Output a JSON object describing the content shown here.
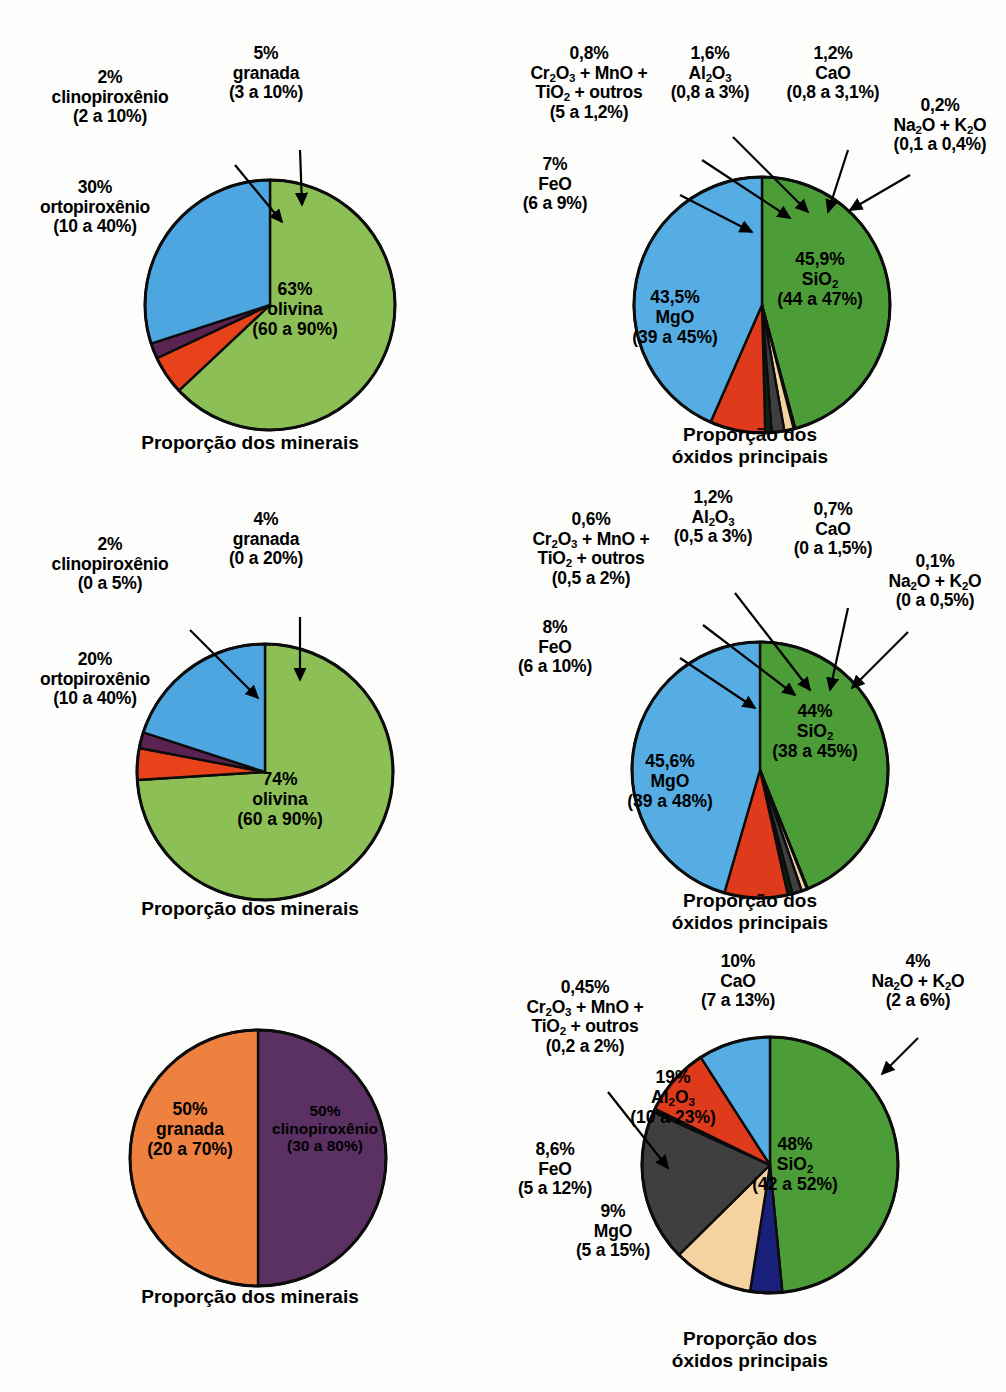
{
  "figure": {
    "background": "#fdfdfb",
    "width": 1006,
    "height": 1392
  },
  "palette": {
    "olivine_green": "#8cbf55",
    "orthopyroxene_blue": "#4ea6e0",
    "clinopyroxene_purple": "#5a2352",
    "garnet_orange_red": "#e8421a",
    "garnet_orange": "#ef8140",
    "clinopyroxene_dark_purple": "#5b3163",
    "sio2_green": "#4c9c38",
    "mgo_blue": "#55ade4",
    "feo_red": "#e03a1c",
    "al2o3_gray": "#3f3f3f",
    "cao_tan": "#f5d3a0",
    "na2o_k2o_navy": "#18207a",
    "cr2o3_dark": "#0c2414",
    "outline": "#0c0c0c"
  },
  "panels": [
    {
      "id": "peridotite-minerals",
      "title": "Proporção dos minerais",
      "chart_data": {
        "type": "pie",
        "title": "Proporção dos minerais",
        "categories": [
          "olivina",
          "ortopiroxênio",
          "clinopiroxênio",
          "granada"
        ],
        "values": [
          63,
          30,
          2,
          5
        ],
        "ranges": [
          "60 a 90%",
          "10 a 40%",
          "2 a 10%",
          "3 a 10%"
        ],
        "colors": [
          "#8cbf55",
          "#4ea6e0",
          "#5a2352",
          "#e8421a"
        ],
        "start_angle_deg": 0,
        "direction": "clockwise"
      },
      "inside_labels": [
        {
          "name": "olivina-slice-label",
          "pct": "63%",
          "species": "olivina",
          "range": "(60 a 90%)"
        }
      ],
      "callout_labels": [
        {
          "name": "ortopiroxenio-label",
          "pct": "30%",
          "species": "ortopiroxênio",
          "range": "(10 a 40%)"
        },
        {
          "name": "clinopiroxenio-label",
          "pct": "2%",
          "species": "clinopiroxênio",
          "range": "(2 a 10%)"
        },
        {
          "name": "granada-label",
          "pct": "5%",
          "species": "granada",
          "range": "(3 a 10%)"
        }
      ]
    },
    {
      "id": "peridotite-oxides",
      "title_line1": "Proporção dos",
      "title_line2": "óxidos principais",
      "chart_data": {
        "type": "pie",
        "title": "Proporção dos óxidos principais",
        "categories": [
          "SiO2",
          "MgO",
          "FeO",
          "Cr2O3 + MnO + TiO2 + outros",
          "Al2O3",
          "CaO",
          "Na2O + K2O"
        ],
        "values": [
          45.9,
          43.5,
          7,
          0.8,
          1.6,
          1.2,
          0.2
        ],
        "ranges": [
          "44 a 47%",
          "39 a 45%",
          "6 a 9%",
          "5 a 1,2%",
          "0,8 a 3%",
          "0,8 a 3,1%",
          "0,1 a 0,4%"
        ],
        "colors": [
          "#4c9c38",
          "#55ade4",
          "#e03a1c",
          "#0c2414",
          "#3f3f3f",
          "#f5d3a0",
          "#18207a"
        ],
        "start_angle_deg": 0,
        "direction": "clockwise"
      },
      "inside_labels": [
        {
          "name": "sio2-slice-label",
          "pct": "45,9%",
          "species_html": "SiO<sub>2</sub>",
          "range": "(44 a 47%)"
        },
        {
          "name": "mgo-slice-label",
          "pct": "43,5%",
          "species_html": "MgO",
          "range": "(39 a 45%)"
        }
      ],
      "callout_labels": [
        {
          "name": "feo-label",
          "pct": "7%",
          "species_html": "FeO",
          "range": "(6 a 9%)"
        },
        {
          "name": "cr2o3-label",
          "pct": "0,8%",
          "species_html": "Cr<sub>2</sub>O<sub>3</sub> + MnO +|TiO<sub>2</sub> + outros",
          "range": "(5 a 1,2%)"
        },
        {
          "name": "al2o3-label",
          "pct": "1,6%",
          "species_html": "Al<sub>2</sub>O<sub>3</sub>",
          "range": "(0,8 a 3%)"
        },
        {
          "name": "cao-label",
          "pct": "1,2%",
          "species_html": "CaO",
          "range": "(0,8 a 3,1%)"
        },
        {
          "name": "na2o-k2o-label",
          "pct": "0,2%",
          "species_html": "Na<sub>2</sub>O + K<sub>2</sub>O",
          "range": "(0,1 a 0,4%)"
        }
      ]
    },
    {
      "id": "dunite-minerals",
      "title": "Proporção dos minerais",
      "chart_data": {
        "type": "pie",
        "title": "Proporção dos minerais",
        "categories": [
          "olivina",
          "ortopiroxênio",
          "clinopiroxênio",
          "granada"
        ],
        "values": [
          74,
          20,
          2,
          4
        ],
        "ranges": [
          "60 a 90%",
          "10 a 40%",
          "0 a 5%",
          "0 a 20%"
        ],
        "colors": [
          "#8cbf55",
          "#4ea6e0",
          "#5a2352",
          "#e8421a"
        ],
        "start_angle_deg": 0,
        "direction": "clockwise"
      },
      "inside_labels": [
        {
          "name": "olivina-slice-label",
          "pct": "74%",
          "species": "olivina",
          "range": "(60 a 90%)"
        }
      ],
      "callout_labels": [
        {
          "name": "ortopiroxenio-label",
          "pct": "20%",
          "species": "ortopiroxênio",
          "range": "(10 a 40%)"
        },
        {
          "name": "clinopiroxenio-label",
          "pct": "2%",
          "species": "clinopiroxênio",
          "range": "(0 a 5%)"
        },
        {
          "name": "granada-label",
          "pct": "4%",
          "species": "granada",
          "range": "(0 a 20%)"
        }
      ]
    },
    {
      "id": "dunite-oxides",
      "title_line1": "Proporção dos",
      "title_line2": "óxidos principais",
      "chart_data": {
        "type": "pie",
        "title": "Proporção dos óxidos principais",
        "categories": [
          "SiO2",
          "MgO",
          "FeO",
          "Cr2O3 + MnO + TiO2 + outros",
          "Al2O3",
          "CaO",
          "Na2O + K2O"
        ],
        "values": [
          44,
          45.6,
          8,
          0.6,
          1.2,
          0.7,
          0.1
        ],
        "ranges": [
          "38 a 45%",
          "39 a 48%",
          "6 a 10%",
          "0,5 a 2%",
          "0,5 a 3%",
          "0 a 1,5%",
          "0 a 0,5%"
        ],
        "colors": [
          "#4c9c38",
          "#55ade4",
          "#e03a1c",
          "#0c2414",
          "#3f3f3f",
          "#f5d3a0",
          "#18207a"
        ],
        "start_angle_deg": 0,
        "direction": "clockwise"
      },
      "inside_labels": [
        {
          "name": "sio2-slice-label",
          "pct": "44%",
          "species_html": "SiO<sub>2</sub>",
          "range": "(38 a 45%)"
        },
        {
          "name": "mgo-slice-label",
          "pct": "45,6%",
          "species_html": "MgO",
          "range": "(39 a 48%)"
        }
      ],
      "callout_labels": [
        {
          "name": "feo-label",
          "pct": "8%",
          "species_html": "FeO",
          "range": "(6 a 10%)"
        },
        {
          "name": "cr2o3-label",
          "pct": "0,6%",
          "species_html": "Cr<sub>2</sub>O<sub>3</sub> + MnO +|TiO<sub>2</sub> + outros",
          "range": "(0,5 a 2%)"
        },
        {
          "name": "al2o3-label",
          "pct": "1,2%",
          "species_html": "Al<sub>2</sub>O<sub>3</sub>",
          "range": "(0,5 a 3%)"
        },
        {
          "name": "cao-label",
          "pct": "0,7%",
          "species_html": "CaO",
          "range": "(0 a 1,5%)"
        },
        {
          "name": "na2o-k2o-label",
          "pct": "0,1%",
          "species_html": "Na<sub>2</sub>O + K<sub>2</sub>O",
          "range": "(0 a 0,5%)"
        }
      ]
    },
    {
      "id": "eclogite-minerals",
      "title": "Proporção dos minerais",
      "chart_data": {
        "type": "pie",
        "title": "Proporção dos minerais",
        "categories": [
          "granada",
          "clinopiroxênio"
        ],
        "values": [
          50,
          50
        ],
        "ranges": [
          "20 a 70%",
          "30 a 80%"
        ],
        "colors": [
          "#ef8140",
          "#5b3163"
        ],
        "start_angle_deg": 0,
        "direction": "clockwise"
      },
      "inside_labels": [
        {
          "name": "granada-slice-label",
          "pct": "50%",
          "species": "granada",
          "range": "(20 a 70%)"
        },
        {
          "name": "clinopiroxenio-slice-label",
          "pct": "50%",
          "species": "clinopiroxênio",
          "range": "(30 a 80%)"
        }
      ],
      "callout_labels": []
    },
    {
      "id": "eclogite-oxides",
      "title_line1": "Proporção dos",
      "title_line2": "óxidos principais",
      "chart_data": {
        "type": "pie",
        "title": "Proporção dos óxidos principais",
        "categories": [
          "SiO2",
          "MgO",
          "FeO",
          "Cr2O3 + MnO + TiO2 + outros",
          "Al2O3",
          "CaO",
          "Na2O + K2O"
        ],
        "values": [
          48,
          9,
          8.6,
          0.45,
          19,
          10,
          4
        ],
        "ranges": [
          "42 a 52%",
          "5 a 15%",
          "5 a 12%",
          "0,2 a 2%",
          "10 a 23%",
          "7 a 13%",
          "2 a 6%"
        ],
        "colors": [
          "#4c9c38",
          "#55ade4",
          "#e03a1c",
          "#0c0c0c",
          "#3f3f3f",
          "#f5d3a0",
          "#18207a"
        ],
        "start_angle_deg": 0,
        "direction": "clockwise"
      },
      "inside_labels": [
        {
          "name": "sio2-slice-label",
          "pct": "48%",
          "species_html": "SiO<sub>2</sub>",
          "range": "(42 a 52%)"
        },
        {
          "name": "al2o3-slice-label",
          "pct": "19%",
          "species_html": "Al<sub>2</sub>O<sub>3</sub>",
          "range": "(10 a 23%)"
        }
      ],
      "callout_labels": [
        {
          "name": "cao-label",
          "pct": "10%",
          "species_html": "CaO",
          "range": "(7 a 13%)"
        },
        {
          "name": "na2o-k2o-label",
          "pct": "4%",
          "species_html": "Na<sub>2</sub>O + K<sub>2</sub>O",
          "range": "(2 a 6%)"
        },
        {
          "name": "cr2o3-label",
          "pct": "0,45%",
          "species_html": "Cr<sub>2</sub>O<sub>3</sub> + MnO +|TiO<sub>2</sub> + outros",
          "range": "(0,2 a 2%)"
        },
        {
          "name": "feo-label",
          "pct": "8,6%",
          "species_html": "FeO",
          "range": "(5 a 12%)"
        },
        {
          "name": "mgo-label",
          "pct": "9%",
          "species_html": "MgO",
          "range": "(5 a 15%)"
        }
      ]
    }
  ]
}
